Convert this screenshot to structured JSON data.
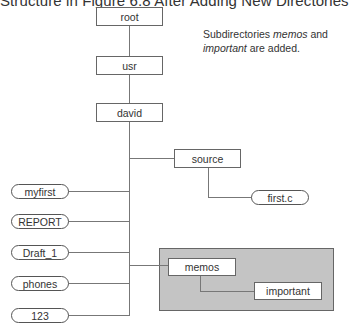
{
  "title": "Structure in Figure 6.8 After Adding New Directories",
  "note": {
    "prefix": "Subdirectories ",
    "term1": "memos",
    "middle": " and",
    "term2": "important",
    "suffix": " are added."
  },
  "directories": {
    "root": "root",
    "usr": "usr",
    "david": "david",
    "source": "source",
    "memos": "memos",
    "important": "important"
  },
  "files": {
    "first_c": "first.c",
    "myfirst": "myfirst",
    "report": "REPORT",
    "draft_1": "Draft_1",
    "phones": "phones",
    "num_123": "123"
  },
  "colors": {
    "highlight_fill": "#c4c4c4",
    "line": "#777777",
    "border": "#666666"
  }
}
